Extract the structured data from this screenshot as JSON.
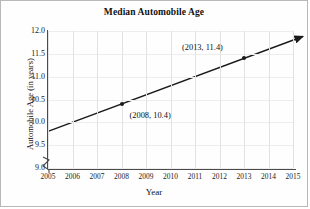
{
  "chart_data": {
    "type": "line",
    "title": "Median Automobile Age",
    "xlabel": "Year",
    "ylabel": "Automobile Age (in years)",
    "x": [
      2005,
      2006,
      2007,
      2008,
      2009,
      2010,
      2011,
      2012,
      2013,
      2014,
      2015
    ],
    "xtick_labels": [
      "2005",
      "2006",
      "2007",
      "2008",
      "2009",
      "2010",
      "2011",
      "2012",
      "2013",
      "2014",
      "2015"
    ],
    "ytick_labels": [
      "12.0",
      "11.5",
      "11.0",
      "10.5",
      "10.0",
      "9.5",
      "9.0"
    ],
    "ytick_values": [
      12.0,
      11.5,
      11.0,
      10.5,
      10.0,
      9.5,
      9.0
    ],
    "xlim": [
      2005,
      2015
    ],
    "ylim": [
      9.0,
      12.0
    ],
    "y_axis_break": true,
    "grid": true,
    "legend": "none",
    "line_color": "#1a1a1a",
    "series": [
      {
        "name": "Median automobile age",
        "slope": 0.2,
        "line_start": {
          "x": 2005,
          "y": 9.8
        },
        "line_end": {
          "x": 2015.4,
          "y": 11.88
        },
        "arrow_end": true,
        "values": [
          9.8,
          10.0,
          10.2,
          10.4,
          10.6,
          10.8,
          11.0,
          11.2,
          11.4,
          11.6,
          11.8
        ]
      }
    ],
    "annotations": [
      {
        "label": "(2008, 10.4)",
        "x": 2008,
        "y": 10.4,
        "marker": true
      },
      {
        "label": "(2013, 11.4)",
        "x": 2013,
        "y": 11.4,
        "marker": true
      }
    ]
  }
}
